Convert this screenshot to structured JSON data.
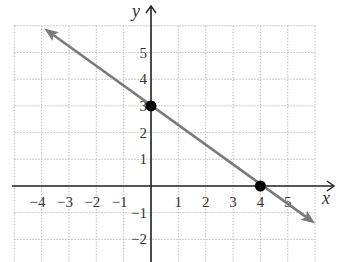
{
  "chart_data": {
    "type": "line",
    "title": "",
    "xlabel": "x",
    "ylabel": "y",
    "xlim": [
      -5,
      6
    ],
    "ylim": [
      -3,
      6
    ],
    "grid": true,
    "grid_style": "dotted",
    "x_ticks": [
      "−4",
      "−3",
      "−2",
      "−1",
      "1",
      "2",
      "3",
      "4",
      "5"
    ],
    "y_ticks": [
      "5",
      "4",
      "3",
      "2",
      "1",
      "−1",
      "−2"
    ],
    "series": [
      {
        "name": "line",
        "equation": "y = -0.75x + 3",
        "color": "#7a7a7a",
        "arrows": "both",
        "x": [
          -3.9,
          6.0
        ],
        "y": [
          5.9,
          -1.4
        ]
      }
    ],
    "points": [
      {
        "label": "y-intercept",
        "x": 0,
        "y": 3
      },
      {
        "label": "x-intercept",
        "x": 4,
        "y": 0
      }
    ],
    "colors": {
      "axis": "#222222",
      "grid": "#bbbbbb",
      "line": "#7a7a7a",
      "point": "#000000"
    }
  }
}
